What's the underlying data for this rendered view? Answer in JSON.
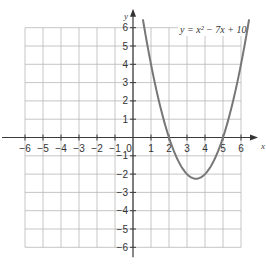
{
  "chart_data": {
    "type": "line",
    "title": "",
    "equation_label": "y = x² − 7x + 10",
    "xlabel": "x",
    "ylabel": "y",
    "xlim": [
      -6,
      6
    ],
    "ylim": [
      -6,
      6
    ],
    "grid": true,
    "x_ticks": [
      -6,
      -5,
      -4,
      -3,
      -2,
      -1,
      0,
      1,
      2,
      3,
      4,
      5,
      6
    ],
    "y_ticks": [
      -6,
      -5,
      -4,
      -3,
      -2,
      -1,
      1,
      2,
      3,
      4,
      5,
      6
    ],
    "series": [
      {
        "name": "y = x² − 7x + 10",
        "function": "x^2 - 7x + 10",
        "x": [
          0.6,
          1,
          1.5,
          2,
          2.5,
          3,
          3.5,
          4,
          4.5,
          5,
          5.5,
          6,
          6.4
        ],
        "y": [
          6.16,
          4,
          1.75,
          0,
          -1.25,
          -2,
          -2.25,
          -2,
          -1.25,
          0,
          1.75,
          4,
          6.16
        ],
        "roots": [
          2,
          5
        ],
        "vertex": [
          3.5,
          -2.25
        ]
      }
    ]
  },
  "labels": {
    "x_axis": "x",
    "y_axis": "y",
    "origin": "0",
    "equation": "y = x² − 7x + 10"
  }
}
